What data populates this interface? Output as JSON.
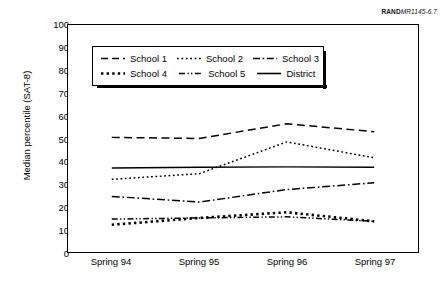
{
  "figure": {
    "credit_bold": "RAND",
    "credit_italic": "MR1145-6.7"
  },
  "legend": {
    "items": [
      {
        "label": "School 1",
        "style": "dashed"
      },
      {
        "label": "School 2",
        "style": "dotted"
      },
      {
        "label": "School 3",
        "style": "dash-dot"
      },
      {
        "label": "School 4",
        "style": "thick-dotted"
      },
      {
        "label": "School 5",
        "style": "dash-dot-dot"
      },
      {
        "label": "District",
        "style": "solid"
      }
    ]
  },
  "chart_data": {
    "type": "line",
    "title": "",
    "xlabel": "",
    "ylabel": "Median percentile (SAT-8)",
    "categories": [
      "Spring 94",
      "Spring 95",
      "Spring 96",
      "Spring 97"
    ],
    "yticks": [
      0,
      10,
      20,
      30,
      40,
      50,
      60,
      70,
      80,
      90,
      100
    ],
    "ylim": [
      0,
      100
    ],
    "grid": false,
    "legend_position": "upper-left-inside",
    "series": [
      {
        "name": "School 1",
        "style": "dashed",
        "values": [
          50.5,
          50.0,
          56.5,
          53.0
        ]
      },
      {
        "name": "School 2",
        "style": "dotted",
        "values": [
          32.0,
          34.5,
          48.5,
          41.5
        ]
      },
      {
        "name": "School 3",
        "style": "dash-dot",
        "values": [
          24.5,
          22.0,
          27.5,
          30.5
        ]
      },
      {
        "name": "School 4",
        "style": "thick-dotted",
        "values": [
          12.0,
          15.0,
          17.5,
          13.5
        ]
      },
      {
        "name": "School 5",
        "style": "dash-dot-dot",
        "values": [
          14.5,
          15.0,
          15.5,
          13.5
        ]
      },
      {
        "name": "District",
        "style": "solid",
        "values": [
          37.0,
          37.3,
          37.5,
          37.3
        ]
      }
    ]
  }
}
